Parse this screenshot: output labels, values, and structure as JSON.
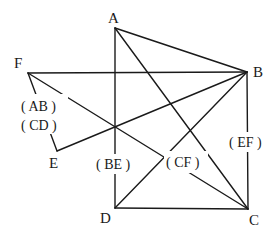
{
  "diagram": {
    "type": "geometry-figure",
    "points": [
      {
        "id": "A",
        "label": "A",
        "x": 115,
        "y": 28
      },
      {
        "id": "B",
        "label": "B",
        "x": 247,
        "y": 72
      },
      {
        "id": "C",
        "label": "C",
        "x": 248,
        "y": 209
      },
      {
        "id": "D",
        "label": "D",
        "x": 115,
        "y": 208
      },
      {
        "id": "E",
        "label": "E",
        "x": 57,
        "y": 151
      },
      {
        "id": "F",
        "label": "F",
        "x": 28,
        "y": 73
      }
    ],
    "segments": [
      [
        "A",
        "B"
      ],
      [
        "A",
        "D"
      ],
      [
        "A",
        "C"
      ],
      [
        "F",
        "B"
      ],
      [
        "F",
        "C"
      ],
      [
        "F",
        "E"
      ],
      [
        "E",
        "B"
      ],
      [
        "D",
        "B"
      ],
      [
        "D",
        "C"
      ],
      [
        "B",
        "C"
      ]
    ],
    "edge_labels": [
      {
        "id": "ab",
        "text": "( AB )"
      },
      {
        "id": "cd",
        "text": "( CD )"
      },
      {
        "id": "be",
        "text": "( BE )"
      },
      {
        "id": "cf",
        "text": "( CF )"
      },
      {
        "id": "ef",
        "text": "( EF )"
      }
    ]
  }
}
